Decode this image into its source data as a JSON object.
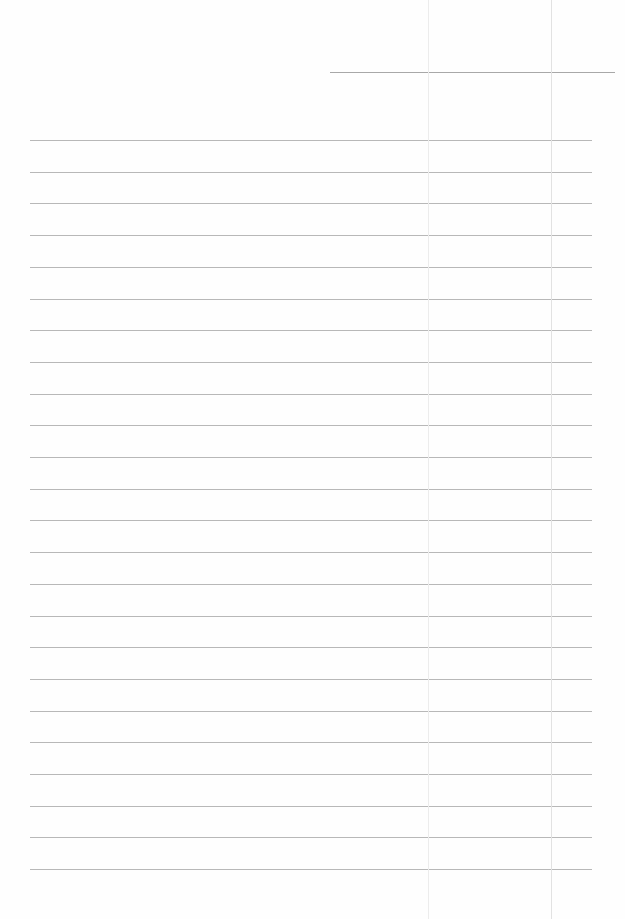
{
  "page": {
    "type": "lined notepaper",
    "background": "#fefefe",
    "line_color": "#b8b8b8",
    "header_line": {
      "x1": 330,
      "x2": 615,
      "y": 72
    },
    "ruled_lines": {
      "count": 24,
      "x1": 30,
      "x2": 592,
      "first_y": 140,
      "spacing": 31.7
    },
    "vertical_guides": [
      {
        "x": 428,
        "color": "#ececec"
      },
      {
        "x": 551,
        "color": "#e2e2e2"
      }
    ]
  }
}
